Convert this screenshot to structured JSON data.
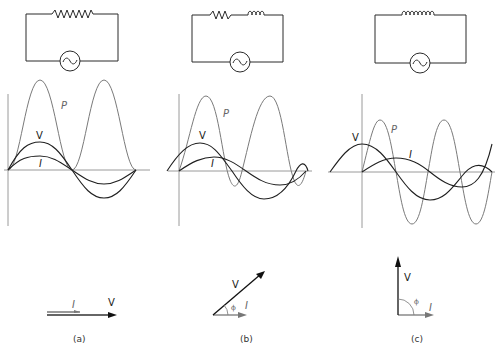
{
  "colors": {
    "voltage": "#1f1f1f",
    "current": "#1f1f1f",
    "power": "#7a7a7a",
    "axis": "#9a9a9a",
    "circuit": "#2a2a2a",
    "phasor_v": "#111111",
    "phasor_i": "#777777"
  },
  "panels": [
    {
      "id": "a",
      "caption": "(a)",
      "circuit": "resistor",
      "phase_deg": 0,
      "labels": {
        "power": "P",
        "voltage": "V",
        "current": "I"
      },
      "phasor": {
        "current": "I",
        "voltage": "V"
      }
    },
    {
      "id": "b",
      "caption": "(b)",
      "circuit": "resistor-inductor",
      "phase_deg": 35,
      "labels": {
        "power": "P",
        "voltage": "V",
        "current": "I"
      },
      "phasor": {
        "current": "I",
        "voltage": "V",
        "angle": "ϕ"
      }
    },
    {
      "id": "c",
      "caption": "(c)",
      "circuit": "inductor",
      "phase_deg": 90,
      "labels": {
        "power": "P",
        "voltage": "V",
        "current": "I"
      },
      "phasor": {
        "current": "I",
        "voltage": "V",
        "angle": "ϕ"
      }
    }
  ],
  "icons": {
    "ac_source": "sine-wave-in-circle",
    "resistor": "zigzag",
    "inductor": "coil-loops"
  }
}
